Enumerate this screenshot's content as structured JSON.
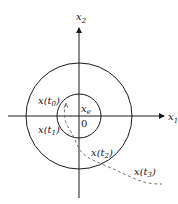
{
  "diagram": {
    "type": "phase-plane stability diagram",
    "axes": {
      "x_label": "x",
      "x_sub": "1",
      "y_label": "x",
      "y_sub": "2"
    },
    "origin_label": "0",
    "equilibrium_label": "x",
    "equilibrium_sub": "e",
    "trajectory_points": [
      {
        "label": "x(",
        "sub": "t",
        "subsub": "0",
        "close": ")"
      },
      {
        "label": "x(",
        "sub": "t",
        "subsub": "1",
        "close": ")"
      },
      {
        "label": "x(",
        "sub": "t",
        "subsub": "2",
        "close": ")"
      },
      {
        "label": "x(",
        "sub": "t",
        "subsub": "3",
        "close": ")"
      }
    ],
    "colors": {
      "line": "#1a1a1a",
      "dashed": "#555555",
      "background": "#ffffff"
    }
  }
}
